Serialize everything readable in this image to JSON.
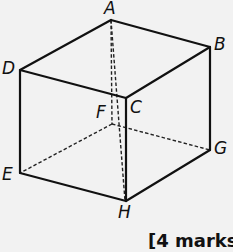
{
  "diagram": {
    "type": "cuboid",
    "vertices": {
      "A": {
        "label": "A",
        "x": 111,
        "y": 20
      },
      "B": {
        "label": "B",
        "x": 210,
        "y": 47
      },
      "C": {
        "label": "C",
        "x": 126,
        "y": 98
      },
      "D": {
        "label": "D",
        "x": 20,
        "y": 70
      },
      "E": {
        "label": "E",
        "x": 20,
        "y": 173
      },
      "F": {
        "label": "F",
        "x": 112,
        "y": 124
      },
      "G": {
        "label": "G",
        "x": 210,
        "y": 150
      },
      "H": {
        "label": "H",
        "x": 126,
        "y": 201
      }
    },
    "solid_edges": [
      "AB",
      "AD",
      "BC",
      "DC",
      "DE",
      "BG",
      "CH",
      "EH",
      "GH"
    ],
    "dashed_edges": [
      "AF",
      "FE",
      "FG",
      "AH"
    ],
    "colors": {
      "line": "#111111",
      "background": "#f2f2f2"
    }
  },
  "marks": {
    "text": "[4 marks]"
  }
}
